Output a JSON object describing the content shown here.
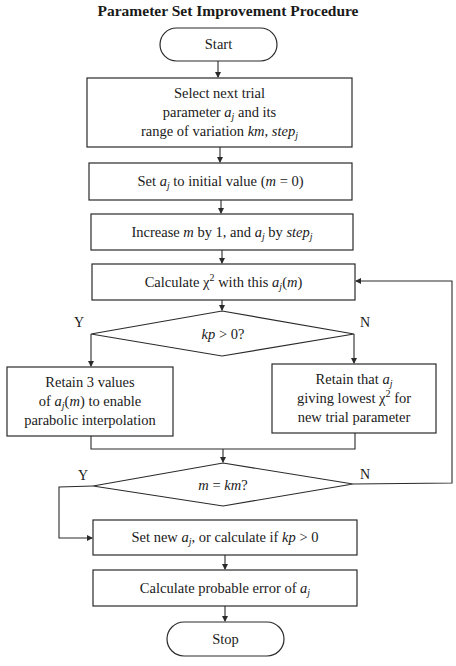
{
  "title": "Parameter Set Improvement Procedure",
  "nodes": {
    "start": {
      "type": "terminal",
      "label": "Start"
    },
    "select": {
      "type": "process",
      "lines": [
        "Select next trial",
        "parameter a_j and its",
        "range of variation km, step_j"
      ]
    },
    "set_initial": {
      "type": "process",
      "label": "Set a_j to initial value (m = 0)"
    },
    "increase": {
      "type": "process",
      "label": "Increase m by 1, and a_j by step_j"
    },
    "calc_chi": {
      "type": "process",
      "label": "Calculate χ² with this a_j(m)"
    },
    "decision_kp": {
      "type": "decision",
      "label": "kp > 0?",
      "yes": "Y",
      "no": "N"
    },
    "retain_three": {
      "type": "process",
      "lines": [
        "Retain 3 values",
        "of a_j(m) to enable",
        "parabolic interpolation"
      ]
    },
    "retain_lowest": {
      "type": "process",
      "lines": [
        "Retain that a_j",
        "giving lowest χ² for",
        "new trial parameter"
      ]
    },
    "decision_m": {
      "type": "decision",
      "label": "m = km?",
      "yes": "Y",
      "no": "N"
    },
    "set_new": {
      "type": "process",
      "label": "Set new a_j, or calculate if kp > 0"
    },
    "prob_error": {
      "type": "process",
      "label": "Calculate probable error of a_j"
    },
    "stop": {
      "type": "terminal",
      "label": "Stop"
    }
  },
  "text": {
    "start": "Start",
    "select_l1": "Select next trial",
    "select_l2a": "parameter ",
    "select_l2v": "a",
    "select_l2s": "j",
    "select_l2b": " and its",
    "select_l3a": "range of variation ",
    "select_l3v": "km",
    "select_l3c": ", ",
    "select_l3w": "step",
    "select_l3s": "j",
    "set_a": "Set ",
    "set_v": "a",
    "set_s": "j",
    "set_b": " to initial value (",
    "set_m": "m",
    "set_c": " = 0)",
    "inc_a": "Increase ",
    "inc_m": "m",
    "inc_b": " by 1, and ",
    "inc_v": "a",
    "inc_s": "j",
    "inc_c": " by ",
    "inc_w": "step",
    "inc_ws": "j",
    "calc_a": "Calculate χ",
    "calc_sup": "2",
    "calc_b": " with this ",
    "calc_v": "a",
    "calc_s": "j",
    "calc_c": "(",
    "calc_m": "m",
    "calc_d": ")",
    "kp_v": "kp",
    "kp_b": " > 0?",
    "r3_l1": "Retain 3 values",
    "r3_a": "of ",
    "r3_v": "a",
    "r3_s": "j",
    "r3_b": "(",
    "r3_m": "m",
    "r3_c": ") to enable",
    "r3_l3": "parabolic interpolation",
    "rl_a": "Retain that ",
    "rl_v": "a",
    "rl_s": "j",
    "rl_l2a": "giving lowest χ",
    "rl_sup": "2",
    "rl_l2b": " for",
    "rl_l3": "new trial parameter",
    "mk_m": "m",
    "mk_b": " = ",
    "mk_k": "km",
    "mk_q": "?",
    "sn_a": "Set new ",
    "sn_v": "a",
    "sn_s": "j",
    "sn_b": ", or calculate if ",
    "sn_k": "kp",
    "sn_c": " > 0",
    "pe_a": "Calculate probable error of ",
    "pe_v": "a",
    "pe_s": "j",
    "stop": "Stop",
    "yes1": "Y",
    "no1": "N",
    "yes2": "Y",
    "no2": "N"
  },
  "edges": [
    [
      "start",
      "select"
    ],
    [
      "select",
      "set_initial"
    ],
    [
      "set_initial",
      "increase"
    ],
    [
      "increase",
      "calc_chi"
    ],
    [
      "calc_chi",
      "decision_kp"
    ],
    [
      "decision_kp",
      "retain_three",
      "Y"
    ],
    [
      "decision_kp",
      "retain_lowest",
      "N"
    ],
    [
      "retain_three",
      "decision_m"
    ],
    [
      "retain_lowest",
      "decision_m"
    ],
    [
      "decision_m",
      "set_new",
      "Y"
    ],
    [
      "decision_m",
      "calc_chi",
      "N"
    ],
    [
      "set_new",
      "prob_error"
    ],
    [
      "prob_error",
      "stop"
    ]
  ],
  "colors": {
    "line": "#2a2a2a",
    "background": "#ffffff",
    "text": "#1a1a1a"
  }
}
